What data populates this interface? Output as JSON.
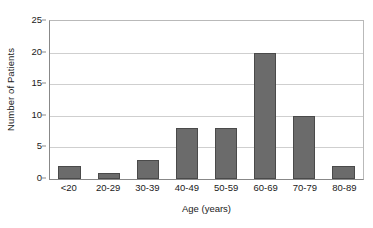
{
  "chart_data": {
    "type": "bar",
    "title": "",
    "categories": [
      "<20",
      "20-29",
      "30-39",
      "40-49",
      "50-59",
      "60-69",
      "70-79",
      "80-89"
    ],
    "values": [
      2,
      1,
      3,
      8,
      8,
      20,
      10,
      2
    ],
    "xlabel": "Age (years)",
    "ylabel": "Number of Patients",
    "ylim": [
      0,
      25
    ],
    "yticks": [
      0,
      5,
      10,
      15,
      20,
      25
    ],
    "ytick_labels": [
      "0",
      "5",
      "10",
      "15",
      "20",
      "25"
    ],
    "grid": "horizontal",
    "legend": "none",
    "bar_color": "#6b6b6b",
    "bar_edge_color": "#4a4a4a",
    "gridline_color": "#cfcfcf",
    "axis_color": "#888888",
    "background_color": "#ffffff"
  }
}
